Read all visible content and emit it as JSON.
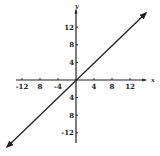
{
  "chart_data": {
    "type": "line",
    "title": "",
    "xlabel": "x",
    "ylabel": "y",
    "equation": "y = x",
    "xlim": [
      -14,
      14
    ],
    "ylim": [
      -14,
      14
    ],
    "grid": false,
    "legend": null,
    "x_ticks": [
      -12,
      -8,
      -4,
      4,
      8,
      12
    ],
    "y_ticks": [
      12,
      8,
      4,
      -4,
      -8,
      -12
    ],
    "x_tick_labels": [
      "-12",
      "8",
      "-4",
      "4",
      "8",
      "12"
    ],
    "y_tick_labels": [
      "12",
      "8",
      "4",
      "4",
      "8",
      "-12"
    ],
    "series": [
      {
        "name": "line",
        "x": [
          -15,
          0,
          15
        ],
        "y": [
          -15,
          0,
          15
        ],
        "arrows": "both"
      }
    ]
  },
  "colors": {
    "ink": "#222222",
    "background": "#ffffff"
  }
}
